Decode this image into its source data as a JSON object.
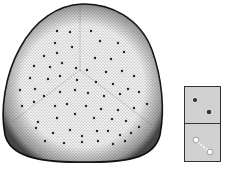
{
  "figure": {
    "colors": {
      "background": "#ffffff",
      "ink": "#1a1a1a",
      "stipple_fill": "#cfcfcf",
      "rim_shade": "#555555",
      "inset_fill": "#d4d4d4"
    },
    "main_grain": {
      "shape": "rounded-triangle",
      "pores_count": 80
    },
    "insets": [
      {
        "name": "inset-top",
        "content": "two dark pores"
      },
      {
        "name": "inset-bottom",
        "content": "light pores connected"
      }
    ]
  }
}
